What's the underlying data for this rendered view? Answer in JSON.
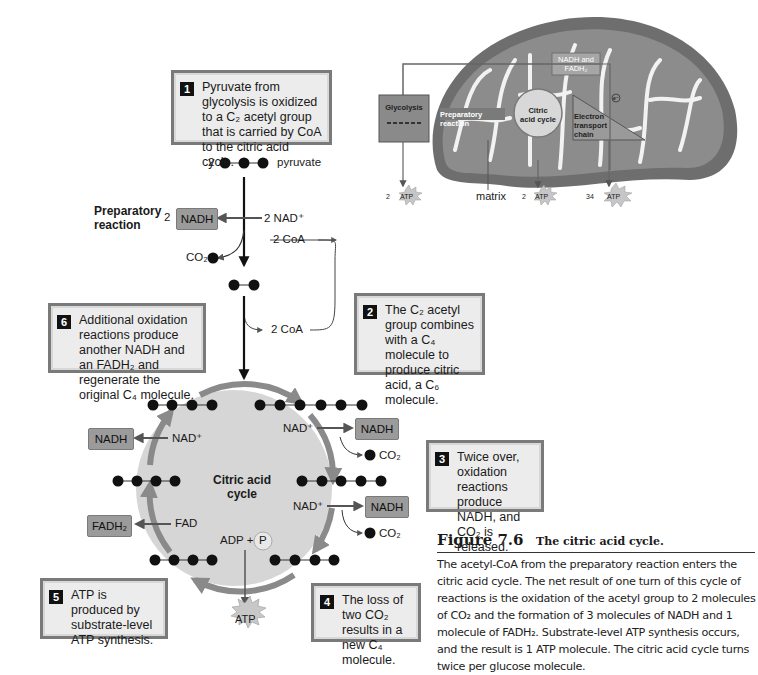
{
  "figure": {
    "number": "Figure 7.6",
    "title": "The citric acid cycle.",
    "caption": "The acetyl-CoA from the preparatory reaction enters the citric acid cycle. The net result of one turn of this cycle of reactions is the oxidation of the acetyl group to 2 molecules of CO₂ and the formation of 3 molecules of NADH and 1 molecule of FADH₂. Substrate-level ATP synthesis occurs, and the result is 1 ATP molecule. The citric acid cycle turns twice per glucose molecule."
  },
  "steps": [
    {
      "num": "1",
      "text": "Pyruvate from glycolysis is oxidized to a C₂ acetyl group that is carried by CoA to the citric acid cycle."
    },
    {
      "num": "2",
      "text": "The C₂ acetyl group combines with a C₄ molecule to produce citric acid, a C₆ molecule."
    },
    {
      "num": "3",
      "text": "Twice over, oxidation reactions produce NADH, and CO₂ is released."
    },
    {
      "num": "4",
      "text": "The loss of two CO₂ results in a new C₄ molecule."
    },
    {
      "num": "5",
      "text": "ATP is produced by substrate-level ATP synthesis."
    },
    {
      "num": "6",
      "text": "Additional oxidation reactions produce another NADH and an FADH₂ and regenerate the original C₄ molecule."
    }
  ],
  "preparatory": {
    "label": "Preparatory reaction",
    "pyruvate_count": "2",
    "pyruvate_label": "pyruvate",
    "nadh_count": "2",
    "nadh": "NADH",
    "nad_in": "2 NAD⁺",
    "coa_in": "2 CoA",
    "coa_out": "2 CoA",
    "co2": "CO₂"
  },
  "cycle": {
    "center_label": "Citric acid cycle",
    "nad1": "NAD⁺",
    "nadh1": "NADH",
    "nad2": "NAD⁺",
    "nadh2": "NADH",
    "nad3": "NAD⁺",
    "nadh3": "NADH",
    "co2_1": "CO₂",
    "co2_2": "CO₂",
    "fad": "FAD",
    "fadh2": "FADH₂",
    "adp": "ADP +",
    "p": "P",
    "atp": "ATP"
  },
  "mitochondrion": {
    "glycolysis": "Glycolysis",
    "preparatory": "Preparatory reaction",
    "citric": "Citric acid cycle",
    "etc": "Electron transport chain",
    "nadh_fadh": "NADH and FADH₂",
    "electron": "e⁻",
    "matrix": "matrix",
    "atp1_count": "2",
    "atp2_count": "2",
    "atp3_count": "34",
    "atp": "ATP"
  },
  "colors": {
    "box_fill": "#ececec",
    "box_border": "#7a7a7a",
    "chem_box": "#9b9b9b",
    "cycle_fill": "#d6d6d6",
    "cycle_arrow": "#8a8a8a",
    "mito_outer": "#6e6e6e",
    "mito_inner": "#8c8c8c"
  }
}
